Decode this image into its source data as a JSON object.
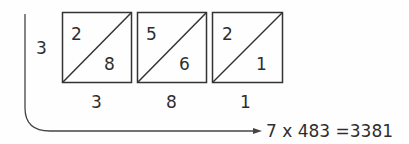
{
  "row_multiplier": "3",
  "cells": [
    {
      "tens": "2",
      "units": "8"
    },
    {
      "tens": "5",
      "units": "6"
    },
    {
      "tens": "2",
      "units": "1"
    }
  ],
  "bottom_digits": [
    "3",
    "8",
    "1"
  ],
  "result_label": "7 x 483 =3381",
  "colors": {
    "line": "#333333",
    "background": "#fefefe"
  }
}
